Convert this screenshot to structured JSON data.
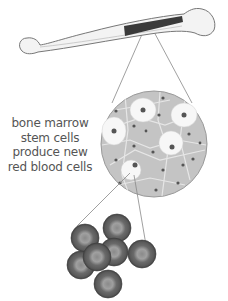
{
  "diagram": {
    "labels": {
      "caption_lines": [
        "bone marrow",
        "stem cells",
        "produce new",
        "red blood cells"
      ]
    },
    "parts": [
      {
        "id": "bone",
        "description": "long bone (femur) with highlighted marrow section"
      },
      {
        "id": "marrow-magnified",
        "description": "magnified circular view of bone marrow tissue with stem cells"
      },
      {
        "id": "red-blood-cells",
        "description": "cluster of seven red blood cells"
      }
    ],
    "colors": {
      "bone_fill": "#f2f2f2",
      "bone_outline": "#777777",
      "marrow_band": "#3a3a3a",
      "tissue_fill": "#bdbdbd",
      "cell_gray": "#6e6e6e",
      "caption_text": "#555555"
    }
  }
}
